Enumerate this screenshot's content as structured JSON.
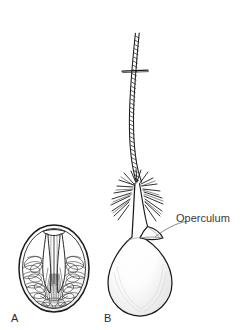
{
  "figure": {
    "kind": "scientific-line-illustration",
    "background_color": "#ffffff",
    "ink_color": "#1a1a1a",
    "shade_color": "#8a8a8a",
    "width": 248,
    "height": 330
  },
  "panels": [
    {
      "id": "A",
      "label": "A",
      "name": "oval-operculate-egg",
      "description": "Oval egg in optical section showing operculum at top and dense coiled internal contents"
    },
    {
      "id": "B",
      "label": "B",
      "name": "filamented-egg",
      "description": "Pear-shaped egg bearing a long striated polar filament, a crown of radiating spines at the neck and a small triangular operculum on the right shoulder"
    }
  ],
  "annotations": [
    {
      "id": "operculum",
      "text": "Operculum",
      "target_panel": "B",
      "leader_from": [
        186,
        222
      ],
      "leader_to": [
        152,
        238
      ]
    }
  ],
  "scale_marker": {
    "present": true,
    "name": "filament-cross-bar",
    "x1": 122,
    "x2": 148,
    "y": 71
  }
}
